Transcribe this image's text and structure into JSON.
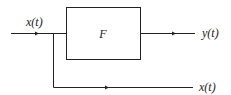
{
  "diagram": {
    "type": "block-diagram",
    "block": {
      "label": "F"
    },
    "input": {
      "label": "x(t)"
    },
    "output": {
      "label": "y(t)"
    },
    "branch_output": {
      "label": "x(t)"
    },
    "colors": {
      "line": "#222222",
      "background": "#ffffff"
    }
  }
}
